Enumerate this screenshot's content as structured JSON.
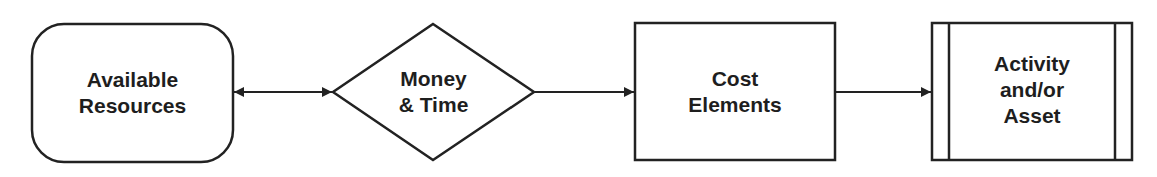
{
  "diagram": {
    "type": "flowchart",
    "nodes": [
      {
        "id": "available-resources",
        "shape": "rounded-rectangle",
        "lines": [
          "Available",
          "Resources"
        ]
      },
      {
        "id": "money-time",
        "shape": "diamond",
        "lines": [
          "Money",
          "& Time"
        ]
      },
      {
        "id": "cost-elements",
        "shape": "rectangle",
        "lines": [
          "Cost",
          "Elements"
        ]
      },
      {
        "id": "activity-asset",
        "shape": "predefined-process",
        "lines": [
          "Activity",
          "and/or",
          "Asset"
        ]
      }
    ],
    "edges": [
      {
        "from": "available-resources",
        "to": "money-time",
        "direction": "bidirectional"
      },
      {
        "from": "money-time",
        "to": "cost-elements",
        "direction": "forward"
      },
      {
        "from": "cost-elements",
        "to": "activity-asset",
        "direction": "forward"
      }
    ],
    "colors": {
      "stroke": "#222222",
      "text": "#1e1e1e",
      "fill": "#ffffff"
    }
  }
}
